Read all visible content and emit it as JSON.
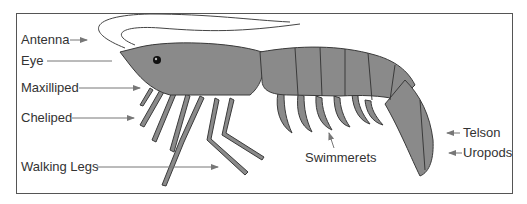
{
  "diagram": {
    "labels": {
      "antenna": "Antenna",
      "eye": "Eye",
      "maxilliped": "Maxilliped",
      "cheliped": "Cheliped",
      "walking_legs": "Walking Legs",
      "swimmerets": "Swimmerets",
      "telson": "Telson",
      "uropods": "Uropods"
    },
    "colors": {
      "body_fill": "#8a8a8a",
      "outline": "#3a3a3a",
      "leader_line": "#777777",
      "frame": "#555555"
    }
  }
}
